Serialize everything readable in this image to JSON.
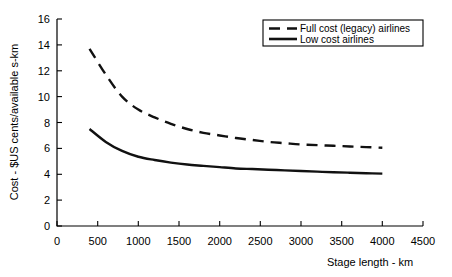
{
  "chart_data": {
    "type": "line",
    "title": "",
    "xlabel": "Stage length - km",
    "ylabel": "Cost - $US cents/available s-km",
    "xlim": [
      0,
      4500
    ],
    "ylim": [
      0,
      16
    ],
    "xticks": [
      0,
      500,
      1000,
      1500,
      2000,
      2500,
      3000,
      3500,
      4000,
      4500
    ],
    "yticks": [
      0,
      2,
      4,
      6,
      8,
      10,
      12,
      14,
      16
    ],
    "grid": false,
    "legend_position": "top-right",
    "series": [
      {
        "name": "Full cost (legacy) airlines",
        "style": "dashed",
        "color": "#111111",
        "x": [
          400,
          600,
          800,
          1000,
          1200,
          1400,
          1600,
          1800,
          2000,
          2200,
          2400,
          2600,
          2800,
          3000,
          3200,
          3400,
          3600,
          3800,
          4000
        ],
        "values": [
          13.7,
          11.7,
          10.0,
          9.0,
          8.4,
          7.9,
          7.5,
          7.2,
          7.0,
          6.8,
          6.65,
          6.5,
          6.4,
          6.3,
          6.25,
          6.2,
          6.15,
          6.1,
          6.05
        ]
      },
      {
        "name": "Low cost airlines",
        "style": "solid",
        "color": "#111111",
        "x": [
          400,
          600,
          800,
          1000,
          1200,
          1400,
          1600,
          1800,
          2000,
          2200,
          2400,
          2600,
          2800,
          3000,
          3200,
          3400,
          3600,
          3800,
          4000
        ],
        "values": [
          7.5,
          6.5,
          5.8,
          5.35,
          5.1,
          4.9,
          4.75,
          4.65,
          4.55,
          4.45,
          4.4,
          4.35,
          4.3,
          4.25,
          4.2,
          4.15,
          4.12,
          4.08,
          4.05
        ]
      }
    ]
  },
  "legend": {
    "entries": [
      {
        "label": "Full cost (legacy) airlines"
      },
      {
        "label": "Low cost airlines"
      }
    ]
  },
  "axes": {
    "x_title": "Stage length - km",
    "y_title": "Cost - $US cents/available s-km",
    "x_tick_labels": [
      "0",
      "500",
      "1000",
      "1500",
      "2000",
      "2500",
      "3000",
      "3500",
      "4000",
      "4500"
    ],
    "y_tick_labels": [
      "0",
      "2",
      "4",
      "6",
      "8",
      "10",
      "12",
      "14",
      "16"
    ]
  }
}
